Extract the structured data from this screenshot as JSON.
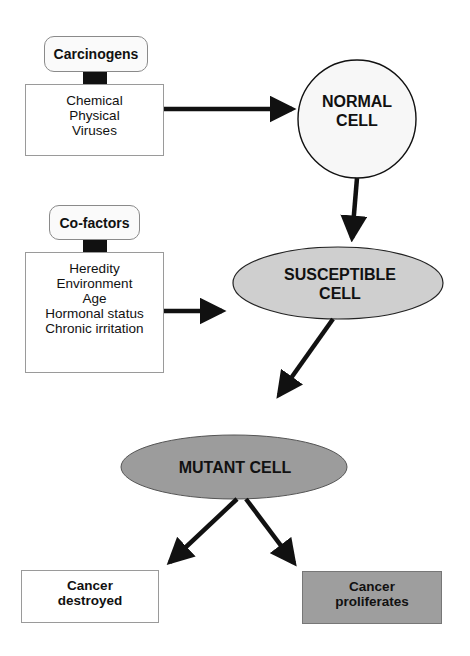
{
  "diagram": {
    "type": "flowchart",
    "colors": {
      "normal_cell_fill": "#f7f7f7",
      "susceptible_cell_fill": "#cfcfcf",
      "mutant_cell_fill": "#9c9c9c",
      "cancer_destroyed_fill": "#ffffff",
      "cancer_proliferates_fill": "#9e9e9e",
      "arrow": "#111111"
    },
    "carcinogens": {
      "label": "Carcinogens",
      "items": [
        "Chemical",
        "Physical",
        "Viruses"
      ]
    },
    "cofactors": {
      "label": "Co-factors",
      "items": [
        "Heredity",
        "Environment",
        "Age",
        "Hormonal status",
        "Chronic irritation"
      ]
    },
    "nodes": {
      "normal_cell": {
        "line1": "NORMAL",
        "line2": "CELL"
      },
      "susceptible_cell": {
        "line1": "SUSCEPTIBLE",
        "line2": "CELL"
      },
      "mutant_cell": {
        "label": "MUTANT CELL"
      }
    },
    "outcomes": {
      "destroyed": {
        "line1": "Cancer",
        "line2": "destroyed"
      },
      "proliferates": {
        "line1": "Cancer",
        "line2": "proliferates"
      }
    },
    "edges": [
      {
        "from": "carcinogens",
        "to": "normal_cell"
      },
      {
        "from": "normal_cell",
        "to": "susceptible_cell"
      },
      {
        "from": "cofactors",
        "to": "susceptible_cell"
      },
      {
        "from": "susceptible_cell",
        "to": "mutant_cell"
      },
      {
        "from": "mutant_cell",
        "to": "cancer_destroyed"
      },
      {
        "from": "mutant_cell",
        "to": "cancer_proliferates"
      }
    ]
  }
}
